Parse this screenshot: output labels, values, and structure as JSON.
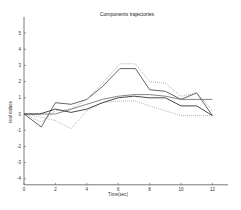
{
  "figure": {
    "title": "Components trajectories",
    "xlabel": "Time(sec)",
    "ylabel": "real values"
  },
  "chart_data": {
    "type": "line",
    "title": "Components trajectories",
    "xlabel": "Time(sec)",
    "ylabel": "real values",
    "xlim": [
      0,
      13
    ],
    "ylim": [
      -4,
      6
    ],
    "xticks": [
      0,
      2,
      4,
      6,
      8,
      10,
      12
    ],
    "yticks": [
      -4,
      -3,
      -2,
      -1,
      0,
      1,
      2,
      3,
      4,
      5
    ],
    "grid": false,
    "legend": null,
    "series": [
      {
        "name": "component 1 (peak)",
        "style": "solid",
        "color": "#555555",
        "x": [
          0,
          1.1,
          2,
          3,
          4,
          5,
          6.1,
          7.1,
          8,
          9,
          10,
          11,
          12
        ],
        "y": [
          0,
          -0.8,
          0.7,
          0.6,
          0.9,
          1.7,
          2.8,
          2.8,
          1.5,
          1.4,
          0.9,
          1.3,
          -0.1
        ]
      },
      {
        "name": "component 1 upper bound",
        "style": "dotted",
        "color": "#999999",
        "x": [
          0,
          1.1,
          2,
          3,
          4,
          5,
          6.1,
          7.1,
          8,
          9,
          10,
          11,
          12
        ],
        "y": [
          0,
          -0.5,
          0.2,
          0.3,
          0.9,
          1.9,
          3.1,
          3.1,
          2.0,
          1.9,
          1.1,
          1.3,
          0.2
        ]
      },
      {
        "name": "component 1 lower bound",
        "style": "dotted",
        "color": "#999999",
        "x": [
          0,
          1.1,
          2,
          3,
          4,
          5,
          6.1,
          7.1,
          8,
          9,
          10,
          11,
          12
        ],
        "y": [
          0,
          -0.2,
          -0.4,
          -0.9,
          0.2,
          0.7,
          0.8,
          0.8,
          0.5,
          0.2,
          -0.1,
          -0.1,
          -0.1
        ]
      },
      {
        "name": "component 2 (flat)",
        "style": "solid",
        "color": "#777777",
        "x": [
          0,
          1,
          2,
          3,
          4,
          5,
          6,
          7,
          8,
          9,
          10,
          11,
          12
        ],
        "y": [
          0,
          0,
          0,
          0.3,
          0.6,
          0.9,
          1.1,
          1.2,
          1.2,
          1.1,
          0.9,
          0.9,
          0.9
        ]
      },
      {
        "name": "component 3 (lower)",
        "style": "solid",
        "color": "#333333",
        "x": [
          0,
          1,
          2,
          3,
          4,
          5,
          6,
          7,
          8,
          9,
          10,
          11,
          12
        ],
        "y": [
          0,
          0,
          0.3,
          0.1,
          0.3,
          0.7,
          1.0,
          1.1,
          1.0,
          1.0,
          0.5,
          0.5,
          -0.1
        ]
      }
    ]
  }
}
